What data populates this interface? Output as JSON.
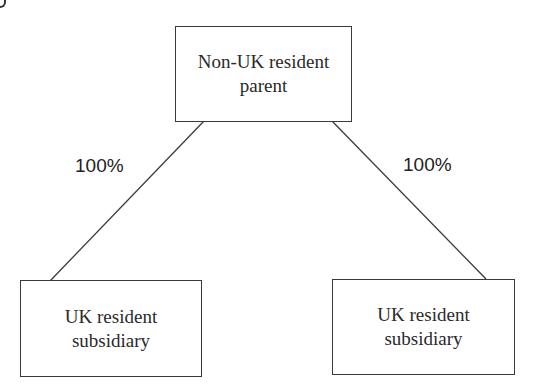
{
  "diagram": {
    "type": "ownership-structure",
    "nodes": [
      {
        "id": "parent",
        "lines": [
          "Non-UK resident",
          "parent"
        ]
      },
      {
        "id": "sub_left",
        "lines": [
          "UK resident",
          "subsidiary"
        ]
      },
      {
        "id": "sub_right",
        "lines": [
          "UK resident",
          "subsidiary"
        ]
      }
    ],
    "edges": [
      {
        "from": "parent",
        "to": "sub_left",
        "label": "100%"
      },
      {
        "from": "parent",
        "to": "sub_right",
        "label": "100%"
      }
    ],
    "colors": {
      "line": "#3a3a3a",
      "text": "#2a2a2a",
      "background": "#ffffff"
    }
  }
}
